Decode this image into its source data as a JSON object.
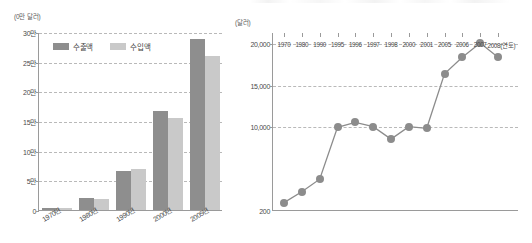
{
  "chart_data": [
    {
      "id": "trade-bar-chart",
      "type": "bar",
      "title": "",
      "unit_label": "(0만 달러)",
      "xlabel": "",
      "ylabel": "",
      "categories": [
        "1970년",
        "1980년",
        "1990년",
        "2000년",
        "2005년"
      ],
      "ytick_labels": [
        "30만",
        "25만",
        "20만",
        "15만",
        "10만",
        "5만",
        "0"
      ],
      "ytick_values": [
        300000,
        250000,
        200000,
        150000,
        100000,
        50000,
        0
      ],
      "ylim": [
        0,
        300000
      ],
      "grid": true,
      "legend_position": "top-left",
      "series": [
        {
          "name": "수출액",
          "color": "#8e8e8e",
          "values": [
            4000,
            20000,
            65000,
            167000,
            289000
          ]
        },
        {
          "name": "수입액",
          "color": "#c9c9c9",
          "values": [
            3500,
            19000,
            69000,
            155000,
            260000
          ]
        }
      ]
    },
    {
      "id": "per-capita-line-chart",
      "type": "line",
      "title": "",
      "unit_label": "(달러)",
      "xlabel": "(연도)",
      "ylabel": "",
      "x": [
        "1970",
        "1980",
        "1990",
        "1995",
        "1996",
        "1997",
        "1998",
        "2000",
        "2001",
        "2005",
        "2006",
        "2007",
        "2008"
      ],
      "xtick_last_suffix": "(연도)",
      "ytick_labels": [
        "20,000",
        "15,000",
        "10,000",
        "200"
      ],
      "ytick_values": [
        20000,
        15000,
        10000,
        200
      ],
      "ylim": [
        200,
        20000
      ],
      "grid": true,
      "legend_position": "none",
      "series": [
        {
          "name": "1인당 국민 총소득",
          "color": "#8c8c8c",
          "values": [
            1000,
            2300,
            3800,
            10000,
            10600,
            10100,
            8600,
            10100,
            9900,
            16400,
            18400,
            20100,
            18400
          ]
        }
      ]
    }
  ],
  "colors": {
    "export_bar": "#8e8e8e",
    "import_bar": "#c9c9c9",
    "line": "#8c8c8c",
    "axis": "#9a9a9a",
    "grid": "#b9b9b9",
    "text": "#4a4a4a",
    "background": "#ffffff"
  }
}
